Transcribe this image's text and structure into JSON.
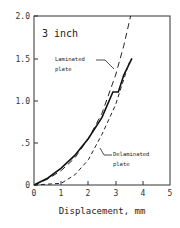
{
  "chart_data": {
    "type": "line",
    "title": "3 inch",
    "xlabel": "Displacement, mm",
    "ylabel": "",
    "xlim": [
      0,
      5
    ],
    "ylim": [
      0,
      2.0
    ],
    "x_ticks": [
      "0",
      "1",
      "2",
      "3",
      "4",
      "5"
    ],
    "y_ticks": [
      "0",
      ".5",
      "1.0",
      "1.5",
      "2.0"
    ],
    "grid": false,
    "legend": "inline annotations",
    "annotations": [
      {
        "text_line1": "Laminated",
        "text_line2": "plate"
      },
      {
        "text_line1": "Delaminated",
        "text_line2": "plate"
      }
    ],
    "series": [
      {
        "name": "Laminated plate",
        "style": "long-dash",
        "x": [
          0,
          0.5,
          1.0,
          1.5,
          2.0,
          2.5,
          3.0,
          3.3,
          3.55
        ],
        "y": [
          0,
          0.07,
          0.17,
          0.32,
          0.55,
          0.85,
          1.3,
          1.65,
          2.0
        ]
      },
      {
        "name": "Experiment",
        "style": "solid",
        "x": [
          0,
          0.5,
          1.0,
          1.5,
          2.0,
          2.5,
          2.9,
          3.1,
          3.3,
          3.6
        ],
        "y": [
          0,
          0.08,
          0.2,
          0.35,
          0.55,
          0.8,
          1.1,
          1.1,
          1.3,
          1.5
        ]
      },
      {
        "name": "Delaminated plate",
        "style": "short-dash",
        "x": [
          0,
          1.0,
          1.5,
          2.0,
          2.5,
          3.0,
          3.5
        ],
        "y": [
          0,
          0.02,
          0.12,
          0.3,
          0.6,
          0.95,
          1.45
        ]
      }
    ]
  }
}
